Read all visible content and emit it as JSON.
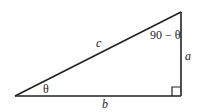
{
  "diagram": {
    "type": "right-triangle",
    "vertices": {
      "left": {
        "x": 15,
        "y": 96
      },
      "right_angle": {
        "x": 181,
        "y": 96
      },
      "top": {
        "x": 181,
        "y": 12
      }
    },
    "right_angle_marker_size": 9,
    "stroke_color": "#222222",
    "labels": {
      "hypotenuse": "c",
      "vertical_side": "a",
      "base": "b",
      "angle_left": "θ",
      "angle_top": "90 − θ"
    }
  }
}
